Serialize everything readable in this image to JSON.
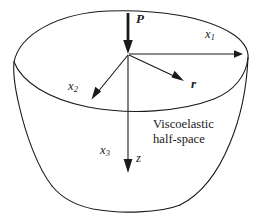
{
  "figure": {
    "background_color": "#ffffff",
    "line_color": "#1a1a1a",
    "text_color": "#1a1a1a",
    "width": 261,
    "height": 220,
    "annotation": {
      "line1": "Viscoelastic",
      "line2": "half-space"
    },
    "labels": {
      "load": "P",
      "axis_x1_base": "x",
      "axis_x1_sub": "1",
      "axis_x2_base": "x",
      "axis_x2_sub": "2",
      "axis_x3_base": "x",
      "axis_x3_sub": "3",
      "radial": "r",
      "depth": "z"
    },
    "vectors": [
      {
        "name": "applied-load",
        "label": "P",
        "direction": "downward-vertical",
        "style": "bold-arrow"
      },
      {
        "name": "axis-x1",
        "label": "x1",
        "direction": "horizontal-right",
        "style": "thin-arrow"
      },
      {
        "name": "axis-x2",
        "label": "x2",
        "direction": "lower-left",
        "style": "thin-arrow"
      },
      {
        "name": "axis-x3",
        "label": "x3",
        "direction": "downward-vertical",
        "style": "thin-arrow"
      },
      {
        "name": "radial-distance",
        "label": "r",
        "direction": "lower-right",
        "style": "thin-arrow"
      }
    ]
  }
}
